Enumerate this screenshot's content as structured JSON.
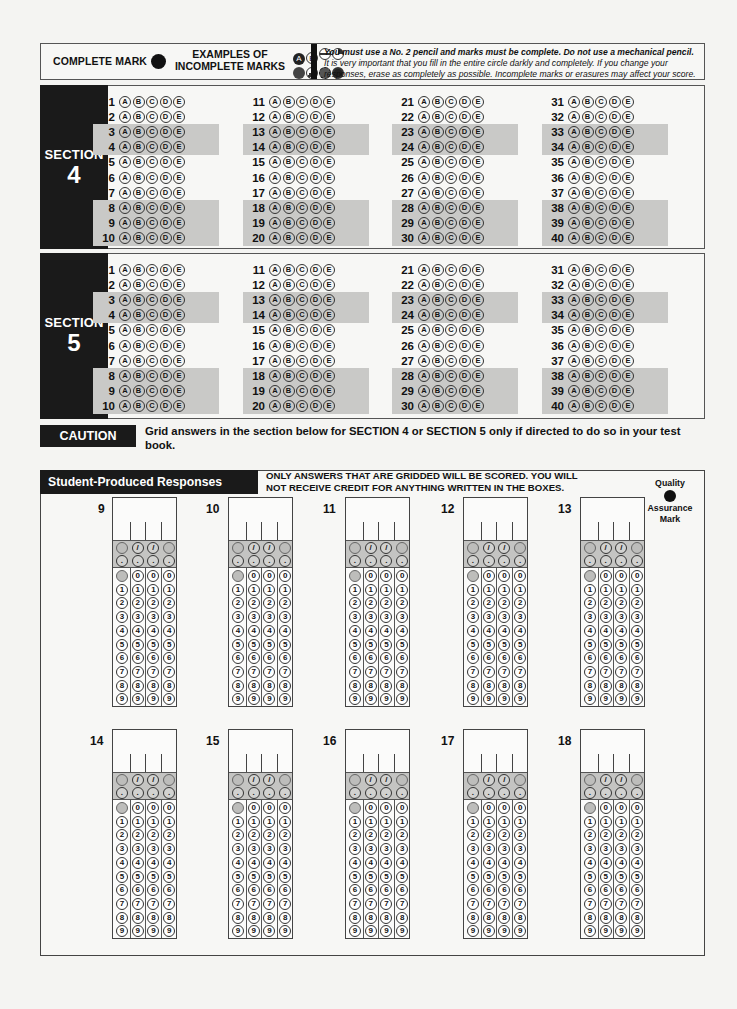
{
  "header": {
    "complete_mark_label": "COMPLETE MARK",
    "examples_label_line1": "EXAMPLES OF",
    "examples_label_line2": "INCOMPLETE MARKS",
    "incomplete_examples": [
      "A",
      "B",
      "-",
      "◔",
      "✱",
      "✎",
      "✺",
      "●"
    ],
    "instructions_bold": "You must use a No. 2 pencil and marks must be complete. Do not use a mechanical pencil.",
    "instructions_rest": " It is very important that you fill in the entire circle darkly and completely. If you change your responses, erase as completely as possible. Incomplete marks or erasures may affect your score."
  },
  "answer_choices": [
    "A",
    "B",
    "C",
    "D",
    "E"
  ],
  "shaded_row_offsets": [
    2,
    3,
    7,
    8,
    9
  ],
  "sections": [
    {
      "label": "SECTION",
      "number": "4",
      "question_start": 1,
      "question_end": 40,
      "columns": 4,
      "rows_per_column": 10
    },
    {
      "label": "SECTION",
      "number": "5",
      "question_start": 1,
      "question_end": 40,
      "columns": 4,
      "rows_per_column": 10
    }
  ],
  "caution": {
    "label": "CAUTION",
    "text": "Grid answers in the section below for SECTION 4 or SECTION 5 only if directed to do so in your test book."
  },
  "student_produced": {
    "title": "Student-Produced Responses",
    "note": "ONLY ANSWERS THAT ARE GRIDDED WILL BE SCORED. YOU WILL NOT RECEIVE CREDIT FOR ANYTHING WRITTEN IN THE BOXES.",
    "quality_mark": {
      "line1": "Quality",
      "line2": "Assurance",
      "line3": "Mark"
    },
    "grid_questions": [
      "9",
      "10",
      "11",
      "12",
      "13",
      "14",
      "15",
      "16",
      "17",
      "18"
    ],
    "digits": [
      "0",
      "1",
      "2",
      "3",
      "4",
      "5",
      "6",
      "7",
      "8",
      "9"
    ],
    "fraction_symbol": "/",
    "decimal_symbol": "."
  }
}
